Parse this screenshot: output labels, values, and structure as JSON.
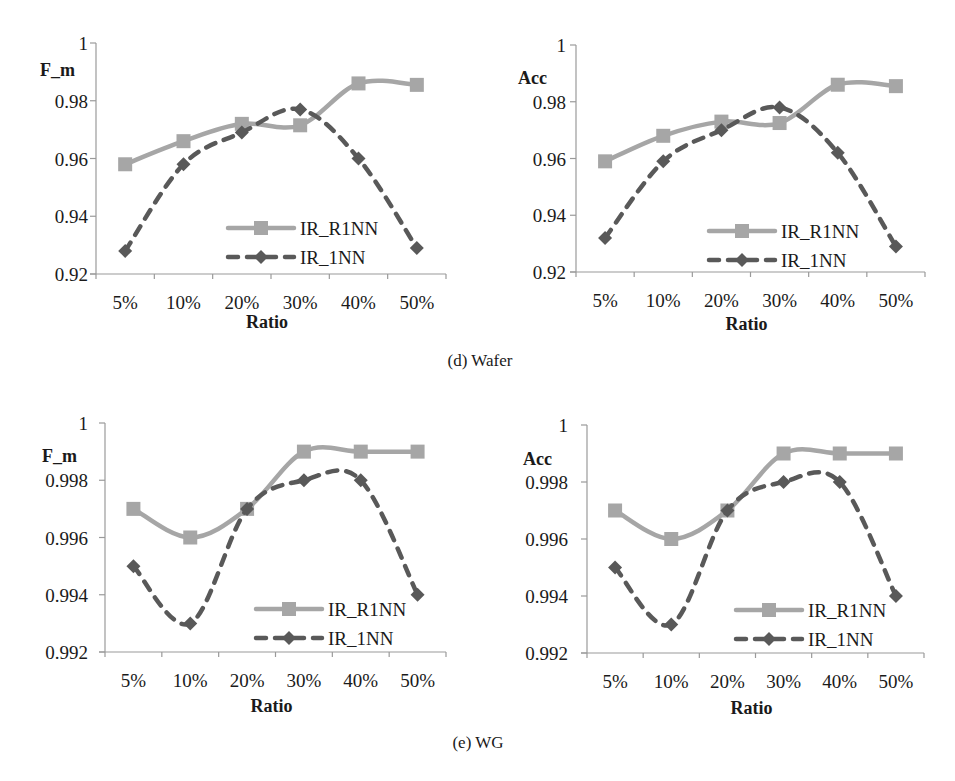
{
  "captions": {
    "wafer": "(d) Wafer",
    "wg": "(e) WG"
  },
  "colors": {
    "ir_r1nn": "#a6a6a6",
    "ir_1nn": "#595959",
    "axis": "#9a9a9a",
    "text": "#1a1a1a"
  },
  "chart_data": [
    {
      "id": "wafer-fm",
      "type": "line",
      "group": "(d) Wafer",
      "title": "",
      "xlabel": "Ratio",
      "ylabel": "F_m",
      "categories": [
        "5%",
        "10%",
        "20%",
        "30%",
        "40%",
        "50%"
      ],
      "yticks": [
        "0.92",
        "0.94",
        "0.96",
        "0.98",
        "1"
      ],
      "ylim": [
        0.92,
        1.0
      ],
      "grid": false,
      "legend_position": "lower right",
      "series": [
        {
          "name": "IR_R1NN",
          "style": "solid",
          "marker": "square",
          "values": [
            0.958,
            0.966,
            0.972,
            0.9715,
            0.986,
            0.9855
          ]
        },
        {
          "name": "IR_1NN",
          "style": "dashed",
          "marker": "diamond",
          "values": [
            0.928,
            0.958,
            0.969,
            0.977,
            0.96,
            0.929
          ]
        }
      ]
    },
    {
      "id": "wafer-acc",
      "type": "line",
      "group": "(d) Wafer",
      "title": "",
      "xlabel": "Ratio",
      "ylabel": "Acc",
      "categories": [
        "5%",
        "10%",
        "20%",
        "30%",
        "40%",
        "50%"
      ],
      "yticks": [
        "0.92",
        "0.94",
        "0.96",
        "0.98",
        "1"
      ],
      "ylim": [
        0.92,
        1.0
      ],
      "grid": false,
      "legend_position": "lower right",
      "series": [
        {
          "name": "IR_R1NN",
          "style": "solid",
          "marker": "square",
          "values": [
            0.959,
            0.968,
            0.973,
            0.9725,
            0.986,
            0.9855
          ]
        },
        {
          "name": "IR_1NN",
          "style": "dashed",
          "marker": "diamond",
          "values": [
            0.932,
            0.959,
            0.97,
            0.978,
            0.962,
            0.929
          ]
        }
      ]
    },
    {
      "id": "wg-fm",
      "type": "line",
      "group": "(e) WG",
      "title": "",
      "xlabel": "Ratio",
      "ylabel": "F_m",
      "categories": [
        "5%",
        "10%",
        "20%",
        "30%",
        "40%",
        "50%"
      ],
      "yticks": [
        "0.992",
        "0.994",
        "0.996",
        "0.998",
        "1"
      ],
      "ylim": [
        0.992,
        1.0
      ],
      "grid": false,
      "legend_position": "lower right",
      "series": [
        {
          "name": "IR_R1NN",
          "style": "solid",
          "marker": "square",
          "values": [
            0.997,
            0.996,
            0.997,
            0.999,
            0.999,
            0.999
          ]
        },
        {
          "name": "IR_1NN",
          "style": "dashed",
          "marker": "diamond",
          "values": [
            0.995,
            0.993,
            0.997,
            0.998,
            0.998,
            0.994
          ]
        }
      ]
    },
    {
      "id": "wg-acc",
      "type": "line",
      "group": "(e) WG",
      "title": "",
      "xlabel": "Ratio",
      "ylabel": "Acc",
      "categories": [
        "5%",
        "10%",
        "20%",
        "30%",
        "40%",
        "50%"
      ],
      "yticks": [
        "0.992",
        "0.994",
        "0.996",
        "0.998",
        "1"
      ],
      "ylim": [
        0.992,
        1.0
      ],
      "grid": false,
      "legend_position": "lower right",
      "series": [
        {
          "name": "IR_R1NN",
          "style": "solid",
          "marker": "square",
          "values": [
            0.997,
            0.996,
            0.997,
            0.999,
            0.999,
            0.999
          ]
        },
        {
          "name": "IR_1NN",
          "style": "dashed",
          "marker": "diamond",
          "values": [
            0.995,
            0.993,
            0.997,
            0.998,
            0.998,
            0.994
          ]
        }
      ]
    }
  ],
  "layout": [
    {
      "chart": 0,
      "x0": 96,
      "x1": 446,
      "yTop": 43,
      "yBot": 274,
      "ylabelX": 40,
      "ylabelY": 76,
      "tickRightX": 88,
      "legendX": 228,
      "legendY": 228,
      "xlabelY": 328
    },
    {
      "chart": 1,
      "x0": 576,
      "x1": 925,
      "yTop": 45,
      "yBot": 272,
      "ylabelX": 518,
      "ylabelY": 84,
      "tickRightX": 566,
      "legendX": 709,
      "legendY": 231,
      "xlabelY": 330
    },
    {
      "chart": 2,
      "x0": 105,
      "x1": 446,
      "yTop": 423,
      "yBot": 652,
      "ylabelX": 42,
      "ylabelY": 462,
      "tickRightX": 88,
      "legendX": 256,
      "legendY": 609,
      "xlabelY": 712
    },
    {
      "chart": 3,
      "x0": 587,
      "x1": 924,
      "yTop": 425,
      "yBot": 653,
      "ylabelX": 523,
      "ylabelY": 465,
      "tickRightX": 568,
      "legendX": 736,
      "legendY": 610,
      "xlabelY": 714
    }
  ]
}
